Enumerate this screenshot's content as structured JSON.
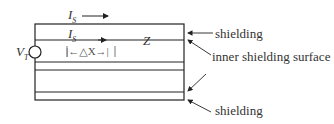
{
  "labels": {
    "is_top": "I",
    "is_top_sub": "S",
    "is_inner": "I",
    "is_inner_sub": "S",
    "vt": "V",
    "vt_sub": "T",
    "delta_x": "|←△X→|",
    "z": "Z",
    "shielding_top": "shielding",
    "inner_surface": "inner shielding surface",
    "shielding_bottom": "shielding"
  },
  "colors": {
    "line": "#222222",
    "text": "#333333"
  }
}
